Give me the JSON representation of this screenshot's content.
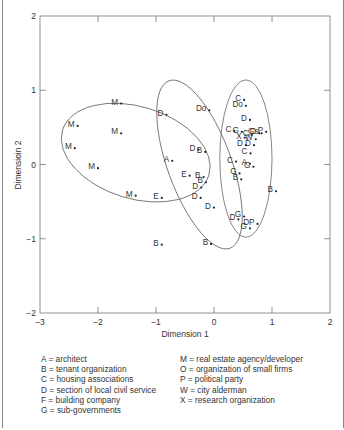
{
  "chart_data": {
    "type": "scatter",
    "title": "",
    "xlabel": "Dimension 1",
    "ylabel": "Dimensioin 2",
    "xlim": [
      -3,
      2
    ],
    "ylim": [
      -2,
      2
    ],
    "xticks": [
      "-3",
      "-2",
      "-1",
      "0",
      "1",
      "2"
    ],
    "yticks": [
      "-2",
      "-1",
      "0",
      "1",
      "2"
    ],
    "grid": false,
    "points": [
      {
        "label": "M",
        "x": -1.6,
        "y": 0.82
      },
      {
        "label": "D",
        "x": -0.82,
        "y": 0.67
      },
      {
        "label": "M",
        "x": -2.35,
        "y": 0.52
      },
      {
        "label": "M",
        "x": -1.6,
        "y": 0.42
      },
      {
        "label": "M",
        "x": -2.4,
        "y": 0.22
      },
      {
        "label": "M",
        "x": -2.0,
        "y": -0.05
      },
      {
        "label": "M",
        "x": -1.35,
        "y": -0.42
      },
      {
        "label": "E",
        "x": -0.9,
        "y": -0.45
      },
      {
        "label": "B",
        "x": -0.9,
        "y": -1.08
      },
      {
        "label": "Do",
        "x": -0.08,
        "y": 0.73
      },
      {
        "label": "A",
        "x": -0.72,
        "y": 0.05
      },
      {
        "label": "D",
        "x": -0.27,
        "y": 0.2
      },
      {
        "label": "B",
        "x": -0.15,
        "y": 0.17
      },
      {
        "label": "E",
        "x": -0.42,
        "y": -0.15
      },
      {
        "label": "B",
        "x": -0.18,
        "y": -0.17
      },
      {
        "label": "B",
        "x": -0.14,
        "y": -0.24
      },
      {
        "label": "D",
        "x": -0.22,
        "y": -0.31
      },
      {
        "label": "D",
        "x": -0.23,
        "y": -0.45
      },
      {
        "label": "D",
        "x": 0.0,
        "y": -0.58
      },
      {
        "label": "B",
        "x": -0.05,
        "y": -1.07
      },
      {
        "label": "C",
        "x": 0.52,
        "y": 0.87
      },
      {
        "label": "Do",
        "x": 0.55,
        "y": 0.79
      },
      {
        "label": "D",
        "x": 0.62,
        "y": 0.6
      },
      {
        "label": "C",
        "x": 0.35,
        "y": 0.45
      },
      {
        "label": "G",
        "x": 0.48,
        "y": 0.44
      },
      {
        "label": "C",
        "x": 0.65,
        "y": 0.4
      },
      {
        "label": "O",
        "x": 0.78,
        "y": 0.42
      },
      {
        "label": "Gs",
        "x": 0.82,
        "y": 0.42
      },
      {
        "label": "P",
        "x": 0.9,
        "y": 0.44
      },
      {
        "label": "X",
        "x": 0.53,
        "y": 0.36
      },
      {
        "label": "W",
        "x": 0.72,
        "y": 0.34
      },
      {
        "label": "D",
        "x": 0.55,
        "y": 0.26
      },
      {
        "label": "D",
        "x": 0.69,
        "y": 0.26
      },
      {
        "label": "C",
        "x": 0.63,
        "y": 0.15
      },
      {
        "label": "C",
        "x": 0.38,
        "y": 0.04
      },
      {
        "label": "A",
        "x": 0.62,
        "y": 0.01
      },
      {
        "label": "G",
        "x": 0.68,
        "y": -0.03
      },
      {
        "label": "G",
        "x": 0.44,
        "y": -0.12
      },
      {
        "label": "B",
        "x": 0.47,
        "y": -0.2
      },
      {
        "label": "B",
        "x": 1.07,
        "y": -0.36
      },
      {
        "label": "D",
        "x": 0.42,
        "y": -0.74
      },
      {
        "label": "G",
        "x": 0.52,
        "y": -0.7
      },
      {
        "label": "G",
        "x": 0.62,
        "y": -0.86
      },
      {
        "label": "DP",
        "x": 0.75,
        "y": -0.8
      }
    ],
    "ellipses": [
      {
        "name": "left-cluster",
        "cx": -1.35,
        "cy": 0.16,
        "rx": 1.32,
        "ry": 0.62,
        "rotate_deg": 17
      },
      {
        "name": "middle-cluster",
        "cx": -0.25,
        "cy": 0.0,
        "rx": 0.55,
        "ry": 1.2,
        "rotate_deg": -20
      },
      {
        "name": "right-cluster",
        "cx": 0.55,
        "cy": 0.08,
        "rx": 0.45,
        "ry": 1.06,
        "rotate_deg": 0
      }
    ],
    "legend": [
      "A = architect",
      "B = tenant organization",
      "C = housing associations",
      "D = section of local civil service",
      "F = building company",
      "G = sub-governments",
      "M = real estate agency/developer",
      "O = organization of small firms",
      "P = political party",
      "W = city alderman",
      "X = research organization"
    ]
  },
  "axis": {
    "xlabel": "Dimension 1",
    "ylabel": "Dimensioin 2"
  },
  "legend_left": [
    "A = architect",
    "B = tenant organization",
    "C = housing associations",
    "D = section of local civil service",
    "F = building company",
    "G = sub-governments"
  ],
  "legend_right": [
    "M = real estate agency/developer",
    "O = organization of small firms",
    "P = political party",
    "W = city alderman",
    "X = research organization"
  ]
}
